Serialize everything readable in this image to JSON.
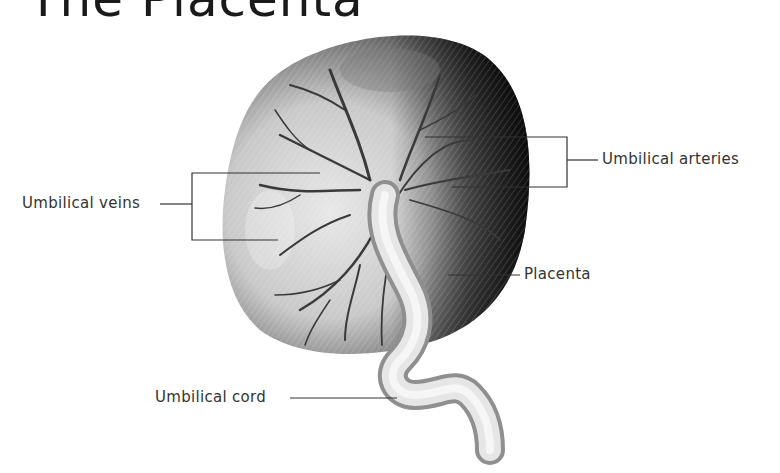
{
  "title": "The Placenta",
  "labels": {
    "umbilical_veins": "Umbilical veins",
    "umbilical_arteries": "Umbilical arteries",
    "placenta": "Placenta",
    "umbilical_cord": "Umbilical cord"
  },
  "colors": {
    "line": "#333333",
    "text": "#333333"
  }
}
